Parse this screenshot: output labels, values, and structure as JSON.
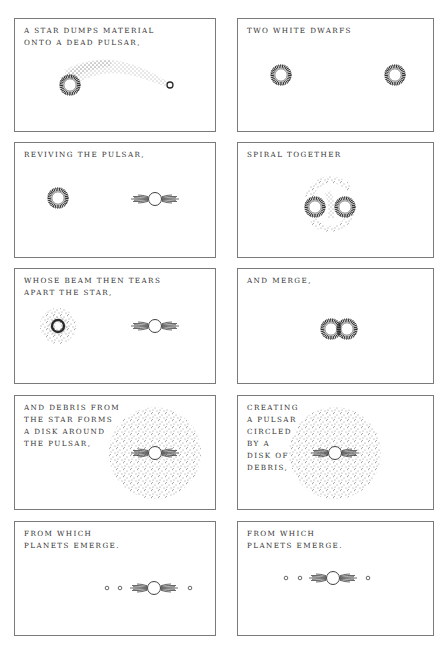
{
  "columns": [
    {
      "name": "pulsar-recycling-scenario",
      "panels": [
        {
          "caption": "A star dumps material\nonto a dead pulsar,"
        },
        {
          "caption": "Reviving the pulsar,"
        },
        {
          "caption": "whose beam then tears\napart the star,"
        },
        {
          "caption": "and debris from\nthe star forms\na disk around\nthe pulsar,"
        },
        {
          "caption": "from which\nplanets emerge."
        }
      ]
    },
    {
      "name": "white-dwarf-merger-scenario",
      "panels": [
        {
          "caption": "Two white dwarfs"
        },
        {
          "caption": "Spiral together"
        },
        {
          "caption": "and merge,"
        },
        {
          "caption": "creating\na pulsar\ncircled\nby a\ndisk of\ndebris,"
        },
        {
          "caption": "from which\nplanets emerge."
        }
      ]
    }
  ],
  "icons": {
    "star": "spiky-ring-icon",
    "pulsar": "pulsar-beam-icon",
    "planet": "small-circle-icon",
    "debris": "dot-cloud"
  },
  "colors": {
    "ink": "#2a2a2a",
    "border": "#7a7a7a",
    "background": "#ffffff"
  }
}
